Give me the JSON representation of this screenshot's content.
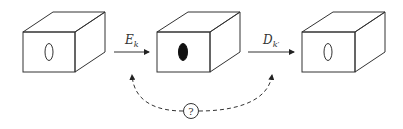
{
  "diagram": {
    "type": "encode-decode-pipeline",
    "boxes": [
      {
        "id": "input",
        "content": "0",
        "content_style": "outlined-ellipse"
      },
      {
        "id": "encoded",
        "content": "",
        "content_style": "filled-ellipse"
      },
      {
        "id": "output",
        "content": "0",
        "content_style": "outlined-ellipse"
      }
    ],
    "arrows": [
      {
        "from": "input",
        "to": "encoded",
        "label_main": "E",
        "label_sub": "k"
      },
      {
        "from": "encoded",
        "to": "output",
        "label_main": "D",
        "label_sub": "k′"
      }
    ],
    "question_link": {
      "symbol": "?",
      "style": "dashed",
      "from_arrow": 0,
      "to_arrow": 1
    }
  }
}
